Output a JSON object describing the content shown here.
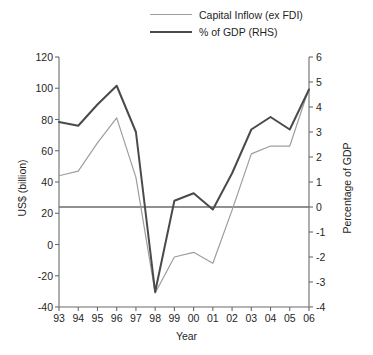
{
  "chart_data": {
    "type": "line",
    "title": "",
    "xlabel": "Year",
    "ylabel": "US$ (billion)",
    "ylabel_right": "Percentage of GDP",
    "x": [
      "93",
      "94",
      "95",
      "96",
      "97",
      "98",
      "99",
      "00",
      "01",
      "02",
      "03",
      "04",
      "05",
      "06"
    ],
    "categories": [
      "93",
      "94",
      "95",
      "96",
      "97",
      "98",
      "99",
      "00",
      "01",
      "02",
      "03",
      "04",
      "05",
      "06"
    ],
    "ylim": [
      -40,
      120
    ],
    "yticks": [
      "120",
      "100",
      "80",
      "60",
      "40",
      "20",
      "0",
      "-20",
      "-40"
    ],
    "ytick_values": [
      120,
      100,
      80,
      60,
      40,
      20,
      0,
      -20,
      -40
    ],
    "ylim_right": [
      -4,
      6
    ],
    "yticks_right": [
      "6",
      "5",
      "4",
      "3",
      "2",
      "1",
      "0",
      "-1",
      "-2",
      "-3",
      "-4"
    ],
    "ytick_right_values": [
      6,
      5,
      4,
      3,
      2,
      1,
      0,
      -1,
      -2,
      -3,
      -4
    ],
    "grid": false,
    "legend_position": "top-center",
    "zero_line_right_axis": 0,
    "series": [
      {
        "name": "Capital Inflow (ex FDI)",
        "axis": "left",
        "color": "#9d9d9d",
        "width": 1.2,
        "values": [
          44,
          47,
          65,
          81,
          43,
          -31,
          -8,
          -5,
          -12,
          22,
          58,
          63,
          63,
          100
        ]
      },
      {
        "name": "% of GDP (RHS)",
        "axis": "right",
        "color": "#4a4a4a",
        "width": 2.0,
        "values": [
          3.4,
          3.25,
          4.1,
          4.85,
          3.0,
          -3.4,
          0.25,
          0.55,
          -0.1,
          1.35,
          3.1,
          3.6,
          3.1,
          4.7
        ]
      }
    ],
    "legend": [
      {
        "label": "Capital Inflow (ex FDI)",
        "style": "thin",
        "color": "#9d9d9d"
      },
      {
        "label": "% of GDP (RHS)",
        "style": "thick",
        "color": "#4a4a4a"
      }
    ],
    "axis_color": "#6b6b6b"
  }
}
